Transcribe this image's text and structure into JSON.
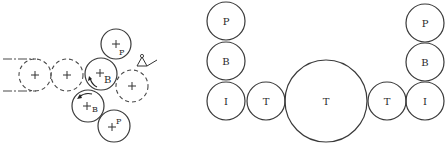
{
  "left_diagram": {
    "description": "Rolling mill roll arrangement (side view)",
    "circles": [
      {
        "id": "pass1",
        "style": "dashed",
        "label": ""
      },
      {
        "id": "pass2",
        "style": "dashed",
        "label": ""
      },
      {
        "id": "upper-work",
        "style": "solid",
        "label": "B"
      },
      {
        "id": "upper-backup",
        "style": "solid",
        "label": "P"
      },
      {
        "id": "exit-pass",
        "style": "dashed",
        "label": ""
      },
      {
        "id": "lower-work",
        "style": "solid",
        "label": "B"
      },
      {
        "id": "lower-backup",
        "style": "solid",
        "label": "P"
      }
    ]
  },
  "right_diagram": {
    "description": "Roll stack arrangement (front view)",
    "left_column": {
      "top": "P",
      "middle": "B",
      "bottom": "I"
    },
    "bottom_row": [
      "I",
      "T",
      "T",
      "T",
      "I"
    ],
    "right_column": {
      "top": "P",
      "middle": "B",
      "bottom": "I"
    }
  },
  "labels": {
    "P": "P",
    "B": "B",
    "I": "I",
    "T": "T"
  }
}
